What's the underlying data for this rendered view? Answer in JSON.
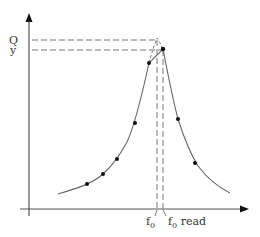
{
  "diagram": {
    "y_axis_labels": {
      "q": "Q",
      "y": "y"
    },
    "x_axis_labels": {
      "f0": "f",
      "f0_sub": "0",
      "f0_read": "f",
      "f0_read_sub": "0",
      "f0_read_suffix": " read"
    },
    "colors": {
      "axis": "#555555",
      "curve": "#666666",
      "dash": "#777777",
      "point": "#111111",
      "text": "#333333"
    },
    "points": [
      {
        "x": 87,
        "y": 184
      },
      {
        "x": 103,
        "y": 174
      },
      {
        "x": 117,
        "y": 159
      },
      {
        "x": 135,
        "y": 123
      },
      {
        "x": 149,
        "y": 63
      },
      {
        "x": 163,
        "y": 49
      },
      {
        "x": 178,
        "y": 119
      },
      {
        "x": 195,
        "y": 163
      }
    ]
  }
}
